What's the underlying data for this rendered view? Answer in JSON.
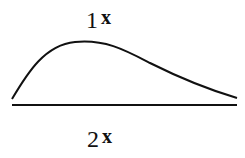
{
  "diagram": {
    "top_label": {
      "number": "1",
      "variable": "x"
    },
    "bottom_label": {
      "number": "2",
      "variable": "x"
    },
    "curve": {
      "description": "skewed hump curve above baseline",
      "color": "#111111"
    },
    "baseline": {
      "color": "#111111"
    }
  }
}
